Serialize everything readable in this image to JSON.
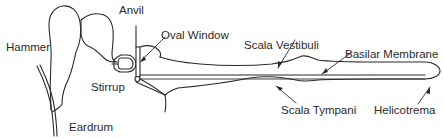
{
  "diagram": {
    "labels": {
      "hammer": "Hammer",
      "anvil": "Anvil",
      "oval_window": "Oval Window",
      "stirrup": "Stirrup",
      "eardrum": "Eardrum",
      "scala_vestibuli": "Scala Vestibuli",
      "basilar_membrane": "Basilar Membrane",
      "scala_tympani": "Scala Tympani",
      "helicotrema": "Helicotrema"
    },
    "colors": {
      "stroke": "#2a2a2a",
      "background": "#ffffff"
    }
  }
}
